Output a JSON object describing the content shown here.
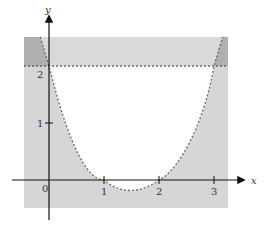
{
  "figure": {
    "axes": {
      "x_label": "x",
      "y_label": "y",
      "x_ticks": [
        "0",
        "1",
        "2",
        "3"
      ],
      "y_ticks": [
        "1",
        "2"
      ]
    },
    "curve": "y = x^2 - 3x + 2 (dashed boundary)",
    "horizontal_line": "y = 2 (dashed)",
    "colors": {
      "region_light": "#d9d9d9",
      "region_overlap": "#b3b3b3",
      "background": "#ffffff",
      "axis": "#111111",
      "dash": "#666666"
    }
  }
}
